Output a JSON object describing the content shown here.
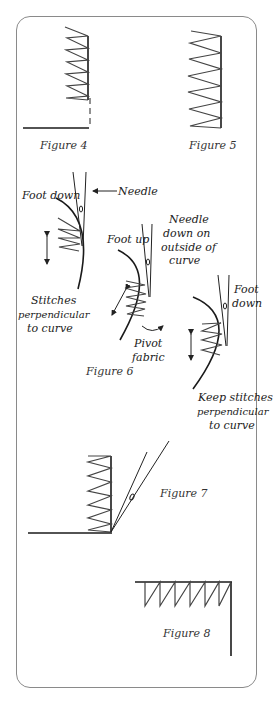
{
  "figures": {
    "fig4": {
      "caption": "Figure 4"
    },
    "fig5": {
      "caption": "Figure 5"
    },
    "fig6": {
      "caption": "Figure 6",
      "foot_down_left": "Foot down",
      "needle": "Needle",
      "stitches_perp": [
        "Stitches",
        "perpendicular",
        "to curve"
      ],
      "foot_up": "Foot up",
      "needle_down": [
        "Needle",
        "down on",
        "outside of",
        "curve"
      ],
      "pivot": [
        "Pivot",
        "fabric"
      ],
      "foot_down_right": [
        "Foot",
        "down"
      ],
      "keep_stitches": [
        "Keep stitches",
        "perpendicular",
        "to curve"
      ]
    },
    "fig7": {
      "caption": "Figure 7"
    },
    "fig8": {
      "caption": "Figure 8"
    }
  },
  "colors": {
    "line": "#1a1a1a",
    "stitch": "#444444",
    "border": "#8a8a8a"
  }
}
